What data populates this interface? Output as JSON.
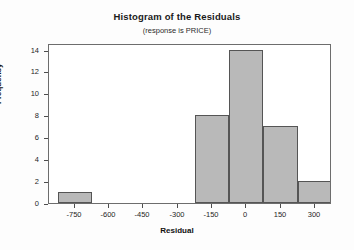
{
  "chart_data": {
    "type": "bar",
    "title": "Histogram of the Residuals",
    "subtitle": "(response is PRICE)",
    "xlabel": "Residual",
    "ylabel": "Frequency",
    "grid": false,
    "legend": "none",
    "bin_width": 150,
    "xlim": [
      -862.5,
      375
    ],
    "ylim": [
      0,
      14.6
    ],
    "xticks": [
      -750,
      -600,
      -450,
      -300,
      -150,
      0,
      150,
      300
    ],
    "xtick_labels": [
      "-750",
      "-600",
      "-450",
      "-300",
      "-150",
      "0",
      "150",
      "300"
    ],
    "yticks": [
      0,
      2,
      4,
      6,
      8,
      10,
      12,
      14
    ],
    "ytick_labels": [
      "0",
      "2",
      "4",
      "6",
      "8",
      "10",
      "12",
      "14"
    ],
    "bin_centers": [
      -750,
      0,
      150,
      300,
      450
    ],
    "bars": [
      {
        "center": -750,
        "left": -825,
        "right": -675,
        "value": 1
      },
      {
        "center": -150,
        "left": -225,
        "right": -75,
        "value": 8
      },
      {
        "center": 0,
        "left": -75,
        "right": 75,
        "value": 14
      },
      {
        "center": 150,
        "left": 75,
        "right": 225,
        "value": 7
      },
      {
        "center": 300,
        "left": 225,
        "right": 375,
        "value": 2
      }
    ],
    "categories": [
      "-750",
      "-150",
      "0",
      "150",
      "300"
    ],
    "values": [
      1,
      8,
      14,
      7,
      2
    ],
    "colors": {
      "bar_fill": "#b9b9b9",
      "bar_edge": "#555555",
      "frame": "#6d6d6d",
      "text": "#1a1a1a",
      "background": "#fdfdfd",
      "plot_background": "#ffffff"
    }
  }
}
